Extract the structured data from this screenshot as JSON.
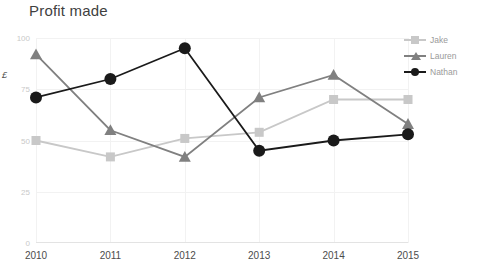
{
  "chart_data": {
    "type": "line",
    "title": "Profit made",
    "xlabel": "",
    "ylabel": "£",
    "categories": [
      "2010",
      "2011",
      "2012",
      "2013",
      "2014",
      "2015"
    ],
    "x": [
      2010,
      2011,
      2012,
      2013,
      2014,
      2015
    ],
    "ylim": [
      0,
      100
    ],
    "xlim": [
      2010,
      2015
    ],
    "yticks": [
      0,
      25,
      50,
      75,
      100
    ],
    "ytick_labels": [
      "0",
      "25",
      "50",
      "75",
      "100"
    ],
    "grid": true,
    "legend_position": "right",
    "series": [
      {
        "name": "Jake",
        "color": "#c8c8c8",
        "marker": "square",
        "values": [
          50,
          42,
          51,
          54,
          70,
          70
        ]
      },
      {
        "name": "Lauren",
        "color": "#808080",
        "marker": "triangle",
        "values": [
          92,
          55,
          42,
          71,
          82,
          58
        ]
      },
      {
        "name": "Nathan",
        "color": "#1a1a1a",
        "marker": "circle",
        "values": [
          71,
          80,
          95,
          45,
          50,
          53
        ]
      }
    ]
  },
  "colors": {
    "background": "#ffffff",
    "title": "#3f3f3f",
    "gridline": "#f2f2f2",
    "axis": "#e3e3e3",
    "ytick": "#c9c9c9",
    "xtick": "#4c4c4c",
    "legend_text": "#9a9a9a"
  }
}
